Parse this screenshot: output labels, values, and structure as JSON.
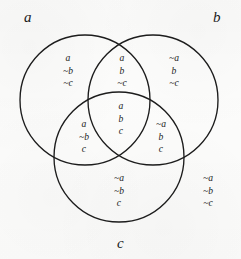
{
  "figure": {
    "kind": "three-set-venn-diagram",
    "width": 241,
    "height": 259,
    "background_color": "#fcfcfb",
    "stroke_color": "#1c1c1c"
  },
  "sets": [
    {
      "id": "a",
      "label": "a",
      "cx": 85,
      "cy": 100,
      "r": 65
    },
    {
      "id": "b",
      "label": "b",
      "cx": 153,
      "cy": 100,
      "r": 65
    },
    {
      "id": "c",
      "label": "c",
      "cx": 119,
      "cy": 157,
      "r": 65
    }
  ],
  "set_labels": [
    {
      "name": "set-label-a",
      "text": "a",
      "x": 24,
      "y": 10
    },
    {
      "name": "set-label-b",
      "text": "b",
      "x": 213,
      "y": 10
    },
    {
      "name": "set-label-c",
      "text": "c",
      "x": 117,
      "y": 236
    }
  ],
  "regions": [
    {
      "name": "region-a-only",
      "membership": "a only",
      "lines": [
        "a",
        "~b",
        "~c"
      ],
      "x": 68,
      "y": 52
    },
    {
      "name": "region-a-and-b",
      "membership": "a and b, not c",
      "lines": [
        "a",
        "b",
        "~c"
      ],
      "x": 122,
      "y": 52
    },
    {
      "name": "region-b-only",
      "membership": "b only",
      "lines": [
        "~a",
        "b",
        "~c"
      ],
      "x": 174,
      "y": 52
    },
    {
      "name": "region-a-and-c",
      "membership": "a and c, not b",
      "lines": [
        "a",
        "~b",
        "c"
      ],
      "x": 84,
      "y": 118
    },
    {
      "name": "region-a-b-c",
      "membership": "a and b and c",
      "lines": [
        "a",
        "b",
        "c"
      ],
      "x": 121,
      "y": 100
    },
    {
      "name": "region-b-and-c",
      "membership": "b and c, not a",
      "lines": [
        "~a",
        "b",
        "c"
      ],
      "x": 161,
      "y": 118
    },
    {
      "name": "region-c-only",
      "membership": "c only",
      "lines": [
        "~a",
        "~b",
        "c"
      ],
      "x": 119,
      "y": 172
    },
    {
      "name": "region-outside",
      "membership": "none",
      "lines": [
        "~a",
        "~b",
        "~c"
      ],
      "x": 208,
      "y": 172
    }
  ]
}
